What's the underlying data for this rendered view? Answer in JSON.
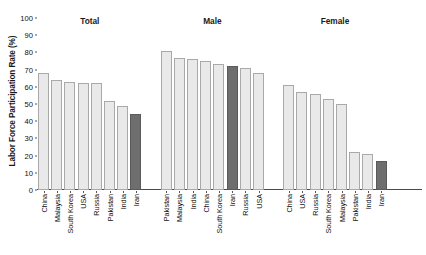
{
  "chart_data": {
    "type": "bar",
    "title": "",
    "xlabel": "",
    "ylabel": "Labor Force Participation Rate (%)",
    "ylim": [
      0,
      100
    ],
    "ytick_labels": [
      "100",
      "90",
      "80",
      "70",
      "60",
      "50",
      "40",
      "30",
      "20",
      "10",
      "0"
    ],
    "ytick_values": [
      100,
      90,
      80,
      70,
      60,
      50,
      40,
      30,
      20,
      10,
      0
    ],
    "grid": false,
    "legend": "none",
    "highlight_category": "Iran",
    "colors": {
      "bar": "#e9e9e9",
      "bar_border": "#a9a9a9",
      "highlight_bar": "#6e6e6e",
      "highlight_border": "#5a5a5a",
      "axis": "#4a4a4a",
      "text": "#111111"
    },
    "groups": [
      {
        "label": "Total",
        "categories": [
          "China",
          "Malaysia",
          "South Korea",
          "USA",
          "Russia",
          "Pakistan",
          "India",
          "Iran"
        ],
        "values": [
          68,
          64,
          63,
          62,
          62,
          52,
          49,
          44
        ]
      },
      {
        "label": "Male",
        "categories": [
          "Pakistan",
          "Malaysia",
          "India",
          "China",
          "South Korea",
          "Iran",
          "Russia",
          "USA"
        ],
        "values": [
          81,
          77,
          76,
          75,
          73,
          72,
          71,
          68
        ]
      },
      {
        "label": "Female",
        "categories": [
          "China",
          "USA",
          "Russia",
          "South Korea",
          "Malaysia",
          "Pakistan",
          "India",
          "Iran"
        ],
        "values": [
          61,
          57,
          56,
          53,
          50,
          22,
          21,
          17
        ]
      }
    ]
  }
}
